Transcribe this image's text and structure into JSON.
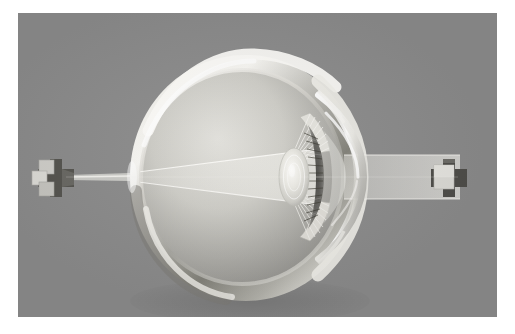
{
  "figure": {
    "medium": "3D rendered grayscale medical illustration",
    "background_color": "#8b8b8b",
    "plate_border_color": "#ffffff",
    "plate": {
      "x": 18,
      "y": 13,
      "width": 479,
      "height": 304
    }
  },
  "palette": {
    "background": "#8b8b8b",
    "sclera_highlight": "#f2f2ee",
    "sclera_mid": "#c9c8c2",
    "sclera_shadow": "#6f6e6a",
    "vitreous_light": "#d8d7d2",
    "vitreous_dark": "#8d8c88",
    "cornea_glass": "#e8e8e4",
    "iris_dark": "#5c5b57",
    "lens_light": "#efeeea",
    "ray_beam": "#e4e3de",
    "marker_face": "#d6d5d0",
    "marker_shadow": "#575652"
  },
  "anatomy": [
    {
      "name": "sclera",
      "label": "Sclera (outer wall)",
      "cx": 228,
      "cy": 167,
      "rx": 116,
      "ry": 122
    },
    {
      "name": "vitreous-body",
      "label": "Vitreous body",
      "cx": 224,
      "cy": 167,
      "rx": 99,
      "ry": 106
    },
    {
      "name": "cornea",
      "label": "Cornea",
      "apex_x": 327,
      "cy": 167
    },
    {
      "name": "anterior-chamber",
      "label": "Anterior chamber",
      "cx": 300,
      "cy": 167
    },
    {
      "name": "iris",
      "label": "Iris",
      "cx": 285,
      "cy": 167,
      "ry": 52
    },
    {
      "name": "pupil",
      "label": "Pupil",
      "cx": 274,
      "cy": 167,
      "ry": 24
    },
    {
      "name": "crystalline-lens",
      "label": "Crystalline lens",
      "cx": 273,
      "cy": 167,
      "rx": 13,
      "ry": 26
    },
    {
      "name": "ciliary-body",
      "label": "Ciliary body",
      "cx": 283,
      "cy": 167
    },
    {
      "name": "zonule-fibers",
      "label": "Zonular fibers (suspensory ligaments)",
      "count": 14
    },
    {
      "name": "retina",
      "label": "Retina",
      "focal_x": 110,
      "focal_y": 158
    },
    {
      "name": "optical-axis",
      "label": "Optical axis",
      "y": 164
    }
  ],
  "optics": {
    "object_marker_right": {
      "label": "Object (cross-shaped target)",
      "cx": 432,
      "cy": 164,
      "arm": 11,
      "depth": 9
    },
    "image_marker_left": {
      "label": "Inverted retinal image marker",
      "cx": 38,
      "cy": 164,
      "arm": 10,
      "depth": 8
    },
    "incoming_beam": {
      "label": "Incoming parallel light beam",
      "from_x": 420,
      "to_x": 330,
      "half_height": 22
    },
    "converging_cone": {
      "label": "Converging cone inside the eye",
      "from_x": 268,
      "to_x": 112,
      "entry_half_height": 28
    },
    "outgoing_ray": {
      "label": "Ray to image marker",
      "from_x": 112,
      "to_x": 48
    },
    "focal_point": {
      "label": "Focal point on retina",
      "x": 112,
      "y": 164
    }
  },
  "icons": {
    "cross_marker": "cross-marker-icon",
    "light_cone": "light-cone-icon",
    "eye": "eye-cross-section-icon"
  }
}
